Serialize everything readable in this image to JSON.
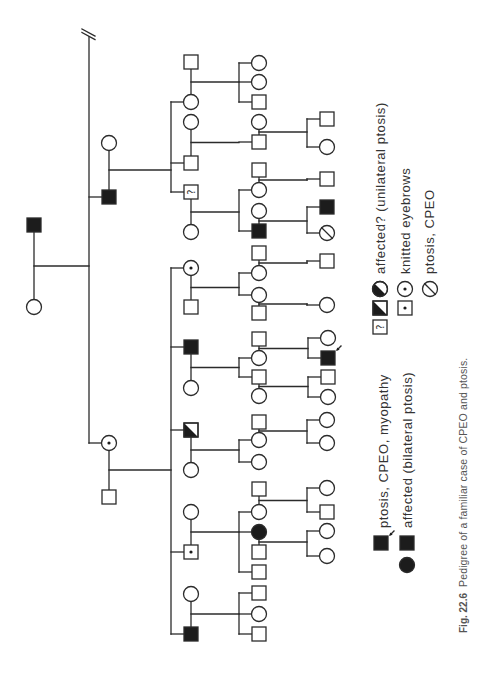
{
  "figure": {
    "label": "Fig. 22.6",
    "caption": "Pedigree of a familiar case of CPEO and ptosis."
  },
  "colors": {
    "line": "#2b2b2b",
    "fill": "#1c1c1c",
    "text": "#333333",
    "caption": "#555555",
    "background": "#ffffff"
  },
  "legend": {
    "uncertain_mark": "?",
    "items": [
      {
        "key": "ptosis-cpeo-myopathy",
        "label": "ptosis, CPEO, myopathy",
        "symbols": [
          {
            "sex": "M",
            "phenotype": "ptosis-cpeo-myopathy",
            "proband": true
          }
        ]
      },
      {
        "key": "affected",
        "label": "affected (bilateral ptosis)",
        "symbols": [
          {
            "sex": "M",
            "phenotype": "affected"
          },
          {
            "sex": "F",
            "phenotype": "affected"
          }
        ]
      },
      {
        "key": "affected-uncertain",
        "label": "affected? (unilateral ptosis)",
        "symbols": [
          {
            "sex": "F",
            "phenotype": "affected-unilateral"
          },
          {
            "sex": "M",
            "phenotype": "affected-unilateral"
          },
          {
            "sex": "M",
            "phenotype": "affected-uncertain"
          }
        ]
      },
      {
        "key": "knitted-eyebrows",
        "label": "knitted eyebrows",
        "symbols": [
          {
            "sex": "F",
            "phenotype": "knitted-eyebrows"
          },
          {
            "sex": "M",
            "phenotype": "knitted-eyebrows"
          }
        ]
      },
      {
        "key": "ptosis-cpeo",
        "label": "ptosis, CPEO",
        "symbols": [
          {
            "sex": "F",
            "phenotype": "ptosis-cpeo"
          }
        ]
      }
    ]
  },
  "pedigree": {
    "individuals": {
      "I1": {
        "sex": "M",
        "phenotype": "affected"
      },
      "I2": {
        "sex": "F",
        "phenotype": "unaffected"
      },
      "II1": {
        "sex": "M",
        "phenotype": "affected"
      },
      "II2": {
        "sex": "F",
        "phenotype": "unaffected"
      },
      "II3": {
        "sex": "F",
        "phenotype": "knitted-eyebrows"
      },
      "II4": {
        "sex": "M",
        "phenotype": "unaffected"
      },
      "III1": {
        "sex": "F",
        "phenotype": "unaffected"
      },
      "III2": {
        "sex": "M",
        "phenotype": "unaffected"
      },
      "III3": {
        "sex": "M",
        "phenotype": "unaffected"
      },
      "III4": {
        "sex": "F",
        "phenotype": "unaffected"
      },
      "III5": {
        "sex": "M",
        "phenotype": "affected-uncertain"
      },
      "III6": {
        "sex": "F",
        "phenotype": "unaffected"
      },
      "III7": {
        "sex": "F",
        "phenotype": "knitted-eyebrows"
      },
      "III8": {
        "sex": "M",
        "phenotype": "unaffected"
      },
      "III9": {
        "sex": "M",
        "phenotype": "affected"
      },
      "III10": {
        "sex": "F",
        "phenotype": "unaffected"
      },
      "III11": {
        "sex": "M",
        "phenotype": "affected-unilateral"
      },
      "III12": {
        "sex": "F",
        "phenotype": "unaffected"
      },
      "III13": {
        "sex": "F",
        "phenotype": "unaffected"
      },
      "III14": {
        "sex": "M",
        "phenotype": "knitted-eyebrows"
      },
      "III15": {
        "sex": "F",
        "phenotype": "unaffected"
      },
      "III16": {
        "sex": "M",
        "phenotype": "affected"
      },
      "IV1": {
        "sex": "F",
        "phenotype": "unaffected"
      },
      "IV2": {
        "sex": "F",
        "phenotype": "unaffected"
      },
      "IV3": {
        "sex": "M",
        "phenotype": "unaffected"
      },
      "IV4": {
        "sex": "F",
        "phenotype": "unaffected"
      },
      "IV5": {
        "sex": "M",
        "phenotype": "unaffected"
      },
      "IV6": {
        "sex": "M",
        "phenotype": "unaffected"
      },
      "IV7": {
        "sex": "F",
        "phenotype": "unaffected"
      },
      "IV8": {
        "sex": "F",
        "phenotype": "unaffected"
      },
      "IV9": {
        "sex": "M",
        "phenotype": "affected"
      },
      "IV10": {
        "sex": "M",
        "phenotype": "unaffected"
      },
      "IV11": {
        "sex": "F",
        "phenotype": "unaffected"
      },
      "IV12": {
        "sex": "F",
        "phenotype": "unaffected"
      },
      "IV13": {
        "sex": "M",
        "phenotype": "unaffected"
      },
      "IV14": {
        "sex": "M",
        "phenotype": "unaffected"
      },
      "IV15": {
        "sex": "F",
        "phenotype": "unaffected"
      },
      "IV16": {
        "sex": "M",
        "phenotype": "unaffected"
      },
      "IV17": {
        "sex": "F",
        "phenotype": "unaffected"
      },
      "IV18": {
        "sex": "M",
        "phenotype": "unaffected"
      },
      "IV19": {
        "sex": "F",
        "phenotype": "unaffected"
      },
      "IV20": {
        "sex": "F",
        "phenotype": "unaffected"
      },
      "IV21": {
        "sex": "M",
        "phenotype": "unaffected"
      },
      "IV22": {
        "sex": "F",
        "phenotype": "unaffected"
      },
      "IV23": {
        "sex": "F",
        "phenotype": "affected"
      },
      "IV24": {
        "sex": "M",
        "phenotype": "unaffected"
      },
      "IV25": {
        "sex": "M",
        "phenotype": "unaffected"
      },
      "IV26": {
        "sex": "M",
        "phenotype": "unaffected"
      },
      "IV27": {
        "sex": "F",
        "phenotype": "unaffected"
      },
      "IV28": {
        "sex": "M",
        "phenotype": "unaffected"
      },
      "V1": {
        "sex": "M",
        "phenotype": "unaffected"
      },
      "V2": {
        "sex": "F",
        "phenotype": "unaffected"
      },
      "V3": {
        "sex": "M",
        "phenotype": "unaffected"
      },
      "V4": {
        "sex": "M",
        "phenotype": "affected"
      },
      "V5": {
        "sex": "F",
        "phenotype": "ptosis-cpeo"
      },
      "V6": {
        "sex": "M",
        "phenotype": "unaffected"
      },
      "V7": {
        "sex": "F",
        "phenotype": "unaffected"
      },
      "V8": {
        "sex": "F",
        "phenotype": "unaffected"
      },
      "V9": {
        "sex": "M",
        "phenotype": "ptosis-cpeo-myopathy",
        "proband": true
      },
      "V10": {
        "sex": "M",
        "phenotype": "unaffected"
      },
      "V11": {
        "sex": "F",
        "phenotype": "unaffected"
      },
      "V12": {
        "sex": "F",
        "phenotype": "unaffected"
      },
      "V13": {
        "sex": "F",
        "phenotype": "unaffected"
      },
      "V14": {
        "sex": "F",
        "phenotype": "unaffected"
      },
      "V15": {
        "sex": "M",
        "phenotype": "unaffected"
      },
      "V16": {
        "sex": "F",
        "phenotype": "unaffected"
      },
      "V17": {
        "sex": "F",
        "phenotype": "unaffected"
      }
    },
    "families": [
      {
        "parents": [
          "I1",
          "I2"
        ],
        "children": [
          "II1",
          "II3"
        ],
        "more_siblings_omitted": true
      },
      {
        "parents": [
          "II2",
          "II1"
        ],
        "children": [
          "III1",
          "III3",
          "III5"
        ]
      },
      {
        "parents": [
          "II3",
          "II4"
        ],
        "children": [
          "III7",
          "III9",
          "III11",
          "III14",
          "III16"
        ]
      },
      {
        "parents": [
          "III2",
          "III1"
        ],
        "children": [
          "IV1",
          "IV2",
          "IV3"
        ]
      },
      {
        "parents": [
          "III4",
          "III3"
        ],
        "children": [
          "IV5"
        ]
      },
      {
        "parents": [
          "III5",
          "III6"
        ],
        "children": [
          "IV7",
          "IV9"
        ]
      },
      {
        "parents": [
          "III7",
          "III8"
        ],
        "children": [
          "IV11",
          "IV12"
        ]
      },
      {
        "parents": [
          "III9",
          "III10"
        ],
        "children": [
          "IV15",
          "IV16"
        ]
      },
      {
        "parents": [
          "III11",
          "III12"
        ],
        "children": [
          "IV19",
          "IV20"
        ]
      },
      {
        "parents": [
          "III13",
          "III14"
        ],
        "children": [
          "IV22",
          "IV23",
          "IV25"
        ]
      },
      {
        "parents": [
          "III15",
          "III16"
        ],
        "children": [
          "IV26",
          "IV27",
          "IV28"
        ]
      },
      {
        "parents": [
          "IV4",
          "IV5"
        ],
        "children": [
          "V1",
          "V2"
        ]
      },
      {
        "parents": [
          "IV6",
          "IV7"
        ],
        "children": [
          "V3"
        ]
      },
      {
        "parents": [
          "IV8",
          "IV9"
        ],
        "children": [
          "V4",
          "V5"
        ]
      },
      {
        "parents": [
          "IV10",
          "IV11"
        ],
        "children": [
          "V6"
        ]
      },
      {
        "parents": [
          "IV12",
          "IV13"
        ],
        "children": [
          "V7"
        ]
      },
      {
        "parents": [
          "IV14",
          "IV15"
        ],
        "children": [
          "V8",
          "V9"
        ]
      },
      {
        "parents": [
          "IV16",
          "IV17"
        ],
        "children": [
          "V10",
          "V11"
        ]
      },
      {
        "parents": [
          "IV18",
          "IV19"
        ],
        "children": [
          "V12",
          "V13"
        ]
      },
      {
        "parents": [
          "IV21",
          "IV22"
        ],
        "children": [
          "V14",
          "V15"
        ]
      },
      {
        "parents": [
          "IV23",
          "IV24"
        ],
        "children": [
          "V16",
          "V17"
        ]
      }
    ]
  }
}
